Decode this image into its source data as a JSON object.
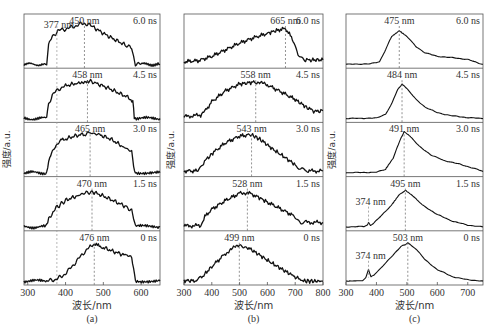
{
  "chart_data": [
    {
      "type": "line",
      "panel_label": "(a)",
      "xlabel": "波长/nm",
      "ylabel": "强度/a.u.",
      "xlim": [
        290,
        650
      ],
      "xticks": [
        300,
        400,
        500,
        600
      ],
      "grid": false,
      "series": [
        {
          "name": "6.0 ns",
          "time": "6.0 ns",
          "peak_label": "450 nm",
          "peak_nm": 450,
          "extra_marker": {
            "label": "377 nm",
            "nm": 377
          },
          "x": [
            290,
            340,
            350,
            355,
            365,
            380,
            400,
            420,
            440,
            450,
            470,
            500,
            530,
            560,
            575,
            580,
            585,
            600,
            650
          ],
          "y": [
            0.02,
            0.02,
            0.05,
            0.45,
            0.65,
            0.78,
            0.82,
            0.87,
            0.93,
            0.95,
            0.88,
            0.72,
            0.58,
            0.45,
            0.38,
            0.2,
            0.03,
            0.02,
            0.02
          ]
        },
        {
          "name": "4.5 ns",
          "time": "4.5 ns",
          "peak_label": "458 nm",
          "peak_nm": 458,
          "x": [
            290,
            345,
            350,
            355,
            365,
            380,
            400,
            430,
            458,
            480,
            510,
            540,
            570,
            578,
            582,
            590,
            650
          ],
          "y": [
            0.02,
            0.02,
            0.05,
            0.35,
            0.55,
            0.68,
            0.76,
            0.82,
            0.88,
            0.82,
            0.72,
            0.6,
            0.48,
            0.4,
            0.05,
            0.02,
            0.02
          ]
        },
        {
          "name": "3.0 ns",
          "time": "3.0 ns",
          "peak_label": "465 nm",
          "peak_nm": 465,
          "x": [
            290,
            345,
            350,
            358,
            370,
            390,
            420,
            450,
            465,
            490,
            520,
            550,
            575,
            580,
            585,
            650
          ],
          "y": [
            0.02,
            0.02,
            0.05,
            0.4,
            0.6,
            0.75,
            0.84,
            0.9,
            0.92,
            0.88,
            0.78,
            0.62,
            0.5,
            0.2,
            0.03,
            0.02
          ]
        },
        {
          "name": "1.5 ns",
          "time": "1.5 ns",
          "peak_label": "470 nm",
          "peak_nm": 470,
          "x": [
            290,
            345,
            350,
            358,
            375,
            400,
            430,
            455,
            470,
            500,
            530,
            560,
            575,
            580,
            585,
            650
          ],
          "y": [
            0.02,
            0.02,
            0.05,
            0.25,
            0.45,
            0.62,
            0.72,
            0.8,
            0.82,
            0.72,
            0.6,
            0.48,
            0.4,
            0.2,
            0.03,
            0.02
          ]
        },
        {
          "name": "0 ns",
          "time": "0 ns",
          "peak_label": "476 nm",
          "peak_nm": 476,
          "x": [
            290,
            350,
            370,
            390,
            410,
            430,
            450,
            465,
            476,
            500,
            530,
            560,
            575,
            580,
            585,
            650
          ],
          "y": [
            0.02,
            0.02,
            0.05,
            0.12,
            0.28,
            0.48,
            0.68,
            0.8,
            0.85,
            0.78,
            0.68,
            0.6,
            0.55,
            0.35,
            0.03,
            0.02
          ]
        }
      ]
    },
    {
      "type": "line",
      "panel_label": "(b)",
      "xlabel": "波长/nm",
      "ylabel": "强度/a.u.",
      "xlim": [
        300,
        800
      ],
      "xticks": [
        300,
        400,
        500,
        600,
        700,
        800
      ],
      "grid": false,
      "series": [
        {
          "name": "6.0 ns",
          "time": "6.0 ns",
          "peak_label": "665 nm",
          "peak_nm": 665,
          "x": [
            300,
            350,
            400,
            450,
            500,
            550,
            600,
            640,
            665,
            690,
            710,
            730,
            760,
            800
          ],
          "y": [
            0.08,
            0.1,
            0.2,
            0.35,
            0.5,
            0.62,
            0.72,
            0.8,
            0.83,
            0.6,
            0.22,
            0.12,
            0.12,
            0.12
          ]
        },
        {
          "name": "4.5 ns",
          "time": "4.5 ns",
          "peak_label": "558 nm",
          "peak_nm": 558,
          "x": [
            300,
            360,
            375,
            400,
            450,
            500,
            558,
            600,
            650,
            700,
            740,
            770,
            800
          ],
          "y": [
            0.06,
            0.1,
            0.18,
            0.4,
            0.65,
            0.8,
            0.85,
            0.78,
            0.62,
            0.45,
            0.28,
            0.18,
            0.2
          ]
        },
        {
          "name": "3.0 ns",
          "time": "3.0 ns",
          "peak_label": "543 nm",
          "peak_nm": 543,
          "x": [
            300,
            350,
            370,
            400,
            450,
            500,
            543,
            580,
            620,
            660,
            700,
            720,
            740,
            800
          ],
          "y": [
            0.06,
            0.06,
            0.25,
            0.45,
            0.7,
            0.85,
            0.88,
            0.75,
            0.55,
            0.38,
            0.2,
            0.1,
            0.06,
            0.06
          ]
        },
        {
          "name": "1.5 ns",
          "time": "1.5 ns",
          "peak_label": "528 nm",
          "peak_nm": 528,
          "x": [
            300,
            360,
            375,
            400,
            450,
            500,
            528,
            560,
            600,
            650,
            700,
            720,
            740,
            800
          ],
          "y": [
            0.04,
            0.05,
            0.25,
            0.42,
            0.62,
            0.78,
            0.8,
            0.72,
            0.58,
            0.42,
            0.25,
            0.12,
            0.12,
            0.12
          ]
        },
        {
          "name": "0 ns",
          "time": "0 ns",
          "peak_label": "499 nm",
          "peak_nm": 499,
          "x": [
            300,
            340,
            360,
            400,
            450,
            499,
            530,
            570,
            610,
            650,
            690,
            720,
            730,
            800
          ],
          "y": [
            0.03,
            0.03,
            0.08,
            0.35,
            0.65,
            0.85,
            0.78,
            0.62,
            0.45,
            0.3,
            0.15,
            0.05,
            0.02,
            0.02
          ]
        }
      ]
    },
    {
      "type": "line",
      "panel_label": "(c)",
      "xlabel": "波长/nm",
      "ylabel": "强度/a.u.",
      "xlim": [
        300,
        750
      ],
      "xticks": [
        300,
        400,
        500,
        600,
        700
      ],
      "grid": false,
      "series": [
        {
          "name": "6.0 ns",
          "time": "6.0 ns",
          "peak_label": "475 nm",
          "peak_nm": 475,
          "x": [
            300,
            380,
            410,
            430,
            450,
            475,
            500,
            530,
            560,
            600,
            650,
            700,
            730,
            750
          ],
          "y": [
            0.02,
            0.03,
            0.08,
            0.35,
            0.65,
            0.78,
            0.65,
            0.42,
            0.28,
            0.2,
            0.17,
            0.13,
            0.06,
            0.02
          ]
        },
        {
          "name": "4.5 ns",
          "time": "4.5 ns",
          "peak_label": "484 nm",
          "peak_nm": 484,
          "x": [
            300,
            400,
            430,
            450,
            470,
            484,
            500,
            530,
            560,
            600,
            650,
            700,
            750
          ],
          "y": [
            0.02,
            0.03,
            0.12,
            0.35,
            0.68,
            0.8,
            0.7,
            0.45,
            0.28,
            0.15,
            0.08,
            0.04,
            0.02
          ]
        },
        {
          "name": "3.0 ns",
          "time": "3.0 ns",
          "peak_label": "491 nm",
          "peak_nm": 491,
          "x": [
            300,
            400,
            430,
            455,
            475,
            491,
            510,
            540,
            580,
            620,
            670,
            720,
            750
          ],
          "y": [
            0.02,
            0.03,
            0.1,
            0.35,
            0.72,
            0.95,
            0.85,
            0.62,
            0.42,
            0.3,
            0.22,
            0.12,
            0.05
          ]
        },
        {
          "name": "1.5 ns",
          "time": "1.5 ns",
          "peak_label": "495 nm",
          "peak_nm": 495,
          "extra_marker": {
            "label": "374 nm",
            "nm": 374
          },
          "x": [
            300,
            360,
            370,
            374,
            380,
            390,
            420,
            450,
            475,
            495,
            520,
            550,
            600,
            650,
            700,
            750
          ],
          "y": [
            0.02,
            0.03,
            0.06,
            0.12,
            0.06,
            0.1,
            0.3,
            0.52,
            0.75,
            0.85,
            0.72,
            0.52,
            0.3,
            0.15,
            0.06,
            0.02
          ]
        },
        {
          "name": "0 ns",
          "time": "0 ns",
          "peak_label": "503 nm",
          "peak_nm": 503,
          "extra_marker": {
            "label": "374 nm",
            "nm": 374
          },
          "x": [
            300,
            355,
            365,
            374,
            382,
            390,
            420,
            450,
            480,
            503,
            530,
            560,
            600,
            650,
            700,
            750
          ],
          "y": [
            0.02,
            0.03,
            0.1,
            0.28,
            0.12,
            0.15,
            0.35,
            0.58,
            0.8,
            0.88,
            0.75,
            0.5,
            0.28,
            0.12,
            0.05,
            0.02
          ]
        }
      ]
    }
  ],
  "layout": {
    "panels": [
      {
        "x0": 24,
        "x1": 160,
        "ylabel_x": 10
      },
      {
        "x0": 184,
        "x1": 323,
        "ylabel_x": 174
      },
      {
        "x0": 346,
        "x1": 483,
        "ylabel_x": 335
      }
    ],
    "top": 14,
    "bottom": 285,
    "rows": 5
  }
}
